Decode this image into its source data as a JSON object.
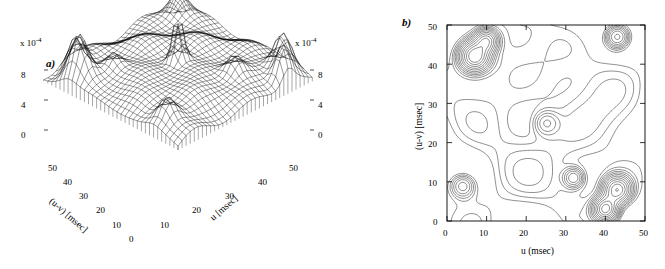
{
  "figure": {
    "panels": [
      {
        "id": "a",
        "letter": "a)",
        "type": "surface3d",
        "scale_label_left": "x 10",
        "scale_exp_left": "-4",
        "scale_label_right": "x 10",
        "scale_exp_right": "-4",
        "zaxis": {
          "ticks_left": [
            "8",
            "4",
            "0"
          ],
          "ticks_right": [
            "8",
            "4",
            "0"
          ],
          "label": ""
        },
        "xaxis": {
          "label": "u [msec]",
          "ticks": [
            "0",
            "10",
            "20",
            "30",
            "40",
            "50"
          ]
        },
        "yaxis": {
          "label": "(u-v) [msec]",
          "ticks": [
            "0",
            "10",
            "20",
            "30",
            "40",
            "50"
          ]
        }
      },
      {
        "id": "b",
        "letter": "b)",
        "type": "contour",
        "xaxis": {
          "label": "u (msec)",
          "ticks": [
            "0",
            "10",
            "20",
            "30",
            "40",
            "50"
          ],
          "range": [
            0,
            50
          ]
        },
        "yaxis": {
          "label": "(u-v) [msec]",
          "ticks": [
            "0",
            "10",
            "20",
            "30",
            "40",
            "50"
          ],
          "range": [
            0,
            50
          ]
        }
      }
    ]
  },
  "chart_data": {
    "type": "contour",
    "title": "",
    "xlabel": "u (msec)",
    "ylabel": "(u-v) [msec]",
    "xlim": [
      0,
      50
    ],
    "ylim": [
      0,
      50
    ],
    "grid": false,
    "legend": "none",
    "panels": [
      {
        "id": "a",
        "type": "surface",
        "zlabel": "x 10^-4",
        "zticks": [
          0,
          4,
          8
        ],
        "description": "3D mesh surface of a joint interval density; broad central plateau with sharp peaks at the corners/edges and a tall central spike",
        "peaks": [
          {
            "u": 5,
            "uv": 42,
            "z": 8
          },
          {
            "u": 25,
            "uv": 25,
            "z": 9.5
          },
          {
            "u": 45,
            "uv": 5,
            "z": 8
          },
          {
            "u": 5,
            "uv": 8,
            "z": 6
          },
          {
            "u": 45,
            "uv": 45,
            "z": 6
          }
        ]
      },
      {
        "id": "b",
        "type": "contour",
        "xlabel": "u (msec)",
        "ylabel": "(u-v) [msec]",
        "xlim": [
          0,
          50
        ],
        "ylim": [
          0,
          50
        ],
        "xticks": [
          0,
          10,
          20,
          30,
          40,
          50
        ],
        "yticks": [
          0,
          10,
          20,
          30,
          40,
          50
        ],
        "hotspots": [
          {
            "u": 7,
            "uv": 42,
            "levels": 9
          },
          {
            "u": 10,
            "uv": 46,
            "levels": 5
          },
          {
            "u": 43,
            "uv": 47,
            "levels": 4
          },
          {
            "u": 43,
            "uv": 8,
            "levels": 7
          },
          {
            "u": 40,
            "uv": 3,
            "levels": 8
          },
          {
            "u": 32,
            "uv": 11,
            "levels": 3
          }
        ]
      }
    ]
  }
}
